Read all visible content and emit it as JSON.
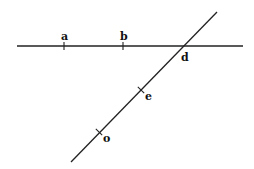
{
  "diagram": {
    "colors": {
      "line": "#222222",
      "text": "#111111",
      "background": "#ffffff"
    },
    "lines": [
      {
        "id": "horizontal",
        "x1": 17,
        "y1": 46,
        "x2": 243,
        "y2": 46
      },
      {
        "id": "diagonal",
        "x1": 217,
        "y1": 12,
        "x2": 71,
        "y2": 162
      }
    ],
    "points": [
      {
        "id": "a",
        "label": "a",
        "x": 64,
        "y": 46,
        "label_x": 61,
        "label_y": 40,
        "tick": "vertical"
      },
      {
        "id": "b",
        "label": "b",
        "x": 123,
        "y": 46,
        "label_x": 120,
        "label_y": 40,
        "tick": "vertical"
      },
      {
        "id": "d",
        "label": "d",
        "x": 182,
        "y": 46,
        "label_x": 181,
        "label_y": 61,
        "tick": "none"
      },
      {
        "id": "e",
        "label": "e",
        "x": 141,
        "y": 90,
        "label_x": 145,
        "label_y": 100,
        "tick": "perpendicular"
      },
      {
        "id": "o",
        "label": "o",
        "x": 99,
        "y": 132,
        "label_x": 103,
        "label_y": 142,
        "tick": "perpendicular"
      }
    ]
  }
}
